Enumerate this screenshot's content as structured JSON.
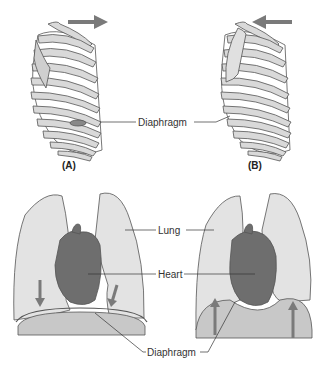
{
  "top": {
    "panel_a": "(A)",
    "panel_b": "(B)",
    "diaphragm_label": "Diaphragm"
  },
  "bottom": {
    "lung_label": "Lung",
    "heart_label": "Heart",
    "diaphragm_label": "Diaphragm"
  },
  "colors": {
    "bone": "#d9d9d9",
    "outline": "#555555",
    "arrow": "#7a7a7a",
    "lung": "#e3e3e3",
    "heart": "#6e6e6e",
    "abdomen": "#c8c8c8"
  }
}
